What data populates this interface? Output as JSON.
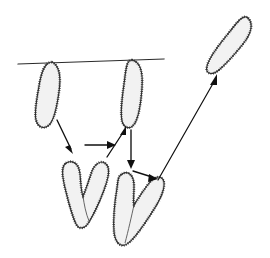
{
  "figure": {
    "background_color": "#ffffff",
    "width": 270,
    "height": 258,
    "caption": ""
  },
  "style": {
    "chromosome_fill": "#f2f2f2",
    "chromosome_outline": "#333333",
    "fuzz_color": "#2b2b2b",
    "line_color": "#2a2a2a",
    "arrow_color": "#101010"
  },
  "chart_data": {
    "type": "diagram",
    "xlabel": "",
    "ylabel": "",
    "xlim": [
      0,
      270
    ],
    "ylim": [
      0,
      258
    ],
    "grid": false,
    "legend": "none",
    "elements": [
      {
        "id": "equator-line",
        "kind": "line",
        "label": "spindle equator line",
        "x1": 18,
        "y1": 64,
        "x2": 164,
        "y2": 59
      },
      {
        "id": "chromosome-top-left",
        "kind": "chromosome",
        "shape": "rod",
        "label": "chromosome at plate, left",
        "cx": 48,
        "cy": 93,
        "angle_deg": -8,
        "length": 62,
        "width": 19,
        "attached_to_line": true
      },
      {
        "id": "chromosome-top-right",
        "kind": "chromosome",
        "shape": "rod",
        "label": "chromosome at plate, right",
        "cx": 133,
        "cy": 95,
        "angle_deg": 6,
        "length": 64,
        "width": 18,
        "attached_to_line": true
      },
      {
        "id": "chromosome-v-left",
        "kind": "chromosome",
        "shape": "v-bent",
        "label": "bent chromosome, lower left",
        "cx": 83,
        "cy": 196,
        "angle_deg": 0,
        "length": 70,
        "width": 46
      },
      {
        "id": "chromosome-v-right",
        "kind": "chromosome",
        "shape": "v-bent",
        "label": "bent chromosome, lower right",
        "cx": 140,
        "cy": 208,
        "angle_deg": 16,
        "length": 72,
        "width": 48
      },
      {
        "id": "chromosome-detached",
        "kind": "chromosome",
        "shape": "rod",
        "label": "released chromosome, upper right",
        "cx": 231,
        "cy": 44,
        "angle_deg": 32,
        "length": 66,
        "width": 20,
        "attached_to_line": false
      },
      {
        "id": "arrow-1",
        "kind": "arrow",
        "label": "left chromosome descends to bent form",
        "from": [
          58,
          122
        ],
        "to": [
          73,
          152
        ]
      },
      {
        "id": "arrow-2",
        "kind": "arrow",
        "label": "transfer left bent to right bent",
        "from": [
          85,
          145
        ],
        "to": [
          114,
          145
        ]
      },
      {
        "id": "arrow-3",
        "kind": "arrow",
        "label": "right bent ascends to plate",
        "from": [
          108,
          157
        ],
        "to": [
          126,
          127
        ]
      },
      {
        "id": "arrow-4",
        "kind": "arrow",
        "label": "right chromosome descends to bent form",
        "from": [
          131,
          131
        ],
        "to": [
          131,
          167
        ]
      },
      {
        "id": "arrow-5",
        "kind": "arrow",
        "label": "short transfer to release path",
        "from": [
          134,
          172
        ],
        "to": [
          157,
          178
        ]
      },
      {
        "id": "arrow-6",
        "kind": "arrow",
        "label": "release toward detached chromosome",
        "from": [
          158,
          180
        ],
        "to": [
          217,
          76
        ]
      }
    ]
  },
  "annotations": {
    "labels": []
  }
}
